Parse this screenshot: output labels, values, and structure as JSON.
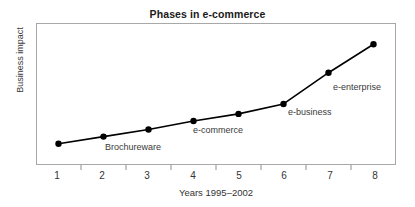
{
  "chart_data": {
    "type": "line",
    "title": "Phases in e-commerce",
    "xlabel": "Years 1995–2002",
    "ylabel": "Business impact",
    "grid": false,
    "legend": "none",
    "xlim": [
      0.5,
      8.5
    ],
    "ylim": [
      0,
      10
    ],
    "x_tick_labels": [
      "1",
      "2",
      "3",
      "4",
      "5",
      "6",
      "7",
      "8"
    ],
    "y_tick_labels": [],
    "x": [
      1,
      2,
      3,
      4,
      5,
      6,
      7,
      8
    ],
    "values": [
      1.5,
      2.0,
      2.5,
      3.1,
      3.6,
      4.3,
      6.5,
      8.5
    ],
    "series": [
      {
        "name": "Business impact",
        "values": [
          1.5,
          2.0,
          2.5,
          3.1,
          3.6,
          4.3,
          6.5,
          8.5
        ]
      }
    ],
    "marker": "filled-circle",
    "line_color": "#000000",
    "marker_color": "#000000",
    "annotations": [
      {
        "text": "Brochureware",
        "x": 2,
        "y": 2.0
      },
      {
        "text": "e-commerce",
        "x": 4,
        "y": 3.1
      },
      {
        "text": "e-business",
        "x": 6,
        "y": 4.3
      },
      {
        "text": "e-enterprise",
        "x": 7,
        "y": 6.5
      }
    ]
  },
  "figure": {
    "title": "Phases in e-commerce",
    "xlabel": "Years 1995–2002",
    "ylabel": "Business impact",
    "background": "#ffffff",
    "frame_color": "#a8a8a8"
  },
  "xticks": {
    "t1": "1",
    "t2": "2",
    "t3": "3",
    "t4": "4",
    "t5": "5",
    "t6": "6",
    "t7": "7",
    "t8": "8"
  },
  "annotations": {
    "a1": "Brochureware",
    "a2": "e-commerce",
    "a3": "e-business",
    "a4": "e-enterprise"
  }
}
